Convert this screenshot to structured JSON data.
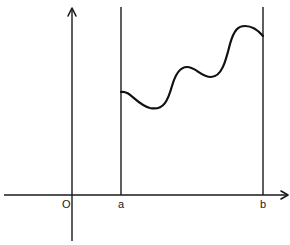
{
  "diagram": {
    "type": "function-graph-definite-integral-region",
    "labels": {
      "origin": "O",
      "left_bound": "a",
      "right_bound": "b"
    },
    "axes": {
      "x_axis": {
        "from": [
          4,
          195
        ],
        "to": [
          288,
          195
        ],
        "arrow": "right"
      },
      "y_axis": {
        "from": [
          72,
          241
        ],
        "to": [
          72,
          8
        ],
        "arrow": "up"
      }
    },
    "bounds": {
      "a": {
        "x": 121,
        "y_top": 7,
        "y_bottom": 195
      },
      "b": {
        "x": 263,
        "y_top": 7,
        "y_bottom": 195
      }
    },
    "curve": {
      "description": "wavy curve f(x) from x=a to x=b",
      "key_points": [
        [
          121,
          92
        ],
        [
          150,
          109
        ],
        [
          187,
          67
        ],
        [
          211,
          77
        ],
        [
          245,
          26
        ],
        [
          263,
          36
        ]
      ]
    },
    "colors": {
      "line": "#1a1a1a",
      "background": "#ffffff"
    }
  }
}
